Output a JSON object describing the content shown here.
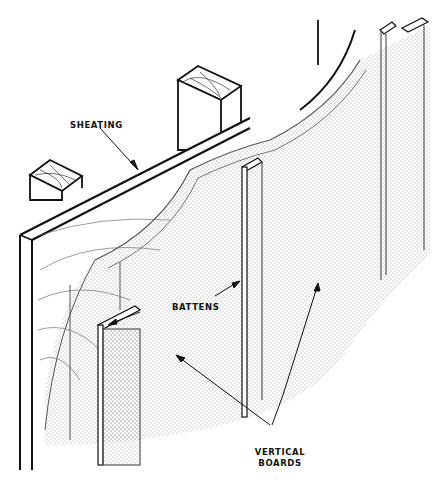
{
  "figure": {
    "labels": {
      "sheathing": "SHEATING",
      "battens": "BATTENS",
      "vertical_boards_line1": "VERTICAL",
      "vertical_boards_line2": "BOARDS"
    },
    "colors": {
      "line": "#111111",
      "stipple": "#8a8a8a",
      "background": "#ffffff"
    }
  }
}
